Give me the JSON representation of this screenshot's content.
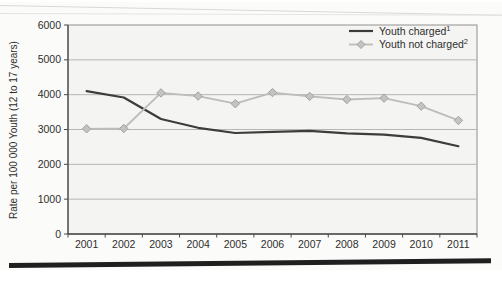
{
  "figure": {
    "background": "#fbfbfa",
    "plot_background": "#f4f4f2",
    "grid_color": "#b6b6b4",
    "border_color": "#8f8f8d",
    "axis_color": "#4a4a48",
    "text_color": "#2e2e2e",
    "bottom_bar_color": "#1f1f1f",
    "tick_font_px": 10.5,
    "legend_font_px": 10.5,
    "ylabel_font_px": 10
  },
  "chart_data": {
    "type": "line",
    "title": "",
    "xlabel": "",
    "ylabel": "Rate per 100 000 Youth (12 to 17 years)",
    "categories": [
      "2001",
      "2002",
      "2003",
      "2004",
      "2005",
      "2006",
      "2007",
      "2008",
      "2009",
      "2010",
      "2011"
    ],
    "ylim": [
      0,
      6000
    ],
    "yticks": [
      0,
      1000,
      2000,
      3000,
      4000,
      5000,
      6000
    ],
    "grid": true,
    "legend_position": "top-right",
    "series": [
      {
        "name": "Youth charged",
        "name_superscript": "1",
        "color": "#3c3c3c",
        "line_width": 2.2,
        "marker": "none",
        "values": [
          4100,
          3920,
          3300,
          3050,
          2900,
          2930,
          2960,
          2890,
          2850,
          2760,
          2520
        ]
      },
      {
        "name": "Youth not charged",
        "name_superscript": "2",
        "color": "#bcbcba",
        "line_width": 1.8,
        "marker": "diamond",
        "marker_fill": "#c3c3c1",
        "marker_stroke": "#a2a2a0",
        "values": [
          3020,
          3030,
          4050,
          3960,
          3740,
          4060,
          3950,
          3860,
          3900,
          3670,
          3260
        ]
      }
    ]
  }
}
